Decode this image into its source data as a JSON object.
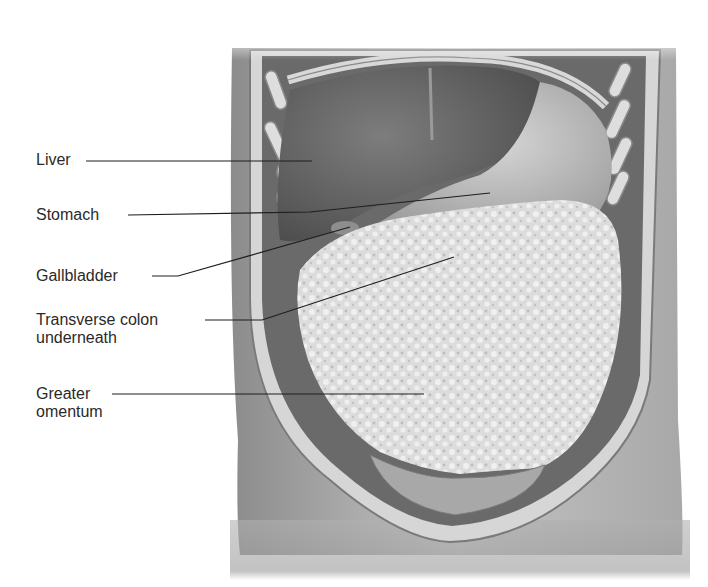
{
  "figure": {
    "colors": {
      "background": "#ffffff",
      "skin": "#b9b9b9",
      "skin_shadow": "#8a8a8a",
      "wall": "#d0d0d0",
      "liver": "#6f6f6f",
      "stomach": "#bdbdbd",
      "omentum": "#e2e2e2",
      "leader_line": "#1e1e1e",
      "text": "#2a2a2a"
    }
  },
  "labels": [
    {
      "id": "liver",
      "lines": [
        "Liver"
      ],
      "text_x": 36,
      "text_y": 149,
      "line": [
        [
          86,
          161
        ],
        [
          312,
          161
        ]
      ]
    },
    {
      "id": "stomach",
      "lines": [
        "Stomach"
      ],
      "text_x": 36,
      "text_y": 204,
      "line": [
        [
          128,
          215
        ],
        [
          310,
          212
        ],
        [
          490,
          193
        ]
      ]
    },
    {
      "id": "gallbladder",
      "lines": [
        "Gallbladder"
      ],
      "text_x": 36,
      "text_y": 262,
      "line": [
        [
          152,
          276
        ],
        [
          178,
          276
        ],
        [
          350,
          227
        ]
      ]
    },
    {
      "id": "transverse-colon",
      "lines": [
        "Transverse colon",
        "underneath"
      ],
      "text_x": 36,
      "text_y": 306,
      "line": [
        [
          205,
          320
        ],
        [
          262,
          320
        ],
        [
          454,
          257
        ]
      ]
    },
    {
      "id": "greater-omentum",
      "lines": [
        "Greater",
        "omentum"
      ],
      "text_x": 36,
      "text_y": 383,
      "line": [
        [
          112,
          394
        ],
        [
          424,
          394
        ]
      ]
    }
  ]
}
